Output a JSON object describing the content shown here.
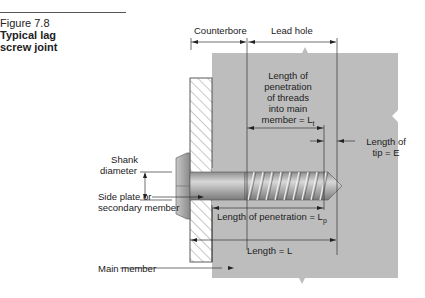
{
  "figure": {
    "number": "Figure 7.8",
    "title_line1": "Typical lag",
    "title_line2": "screw joint"
  },
  "labels": {
    "counterbore": "Counterbore",
    "lead_hole": "Lead hole",
    "threads_line1": "Length of",
    "threads_line2": "penetration",
    "threads_line3": "of threads",
    "threads_line4": "into main",
    "threads_line5": "member = L",
    "threads_sub": "t",
    "tip_line1": "Length of",
    "tip_line2": "tip = E",
    "shank_line1": "Shank",
    "shank_line2": "diameter",
    "side_plate_line1": "Side plate or",
    "side_plate_line2": "secondary member",
    "penetration": "Length of penetration = L",
    "penetration_sub": "p",
    "length": "Length = L",
    "main_member": "Main member"
  },
  "colors": {
    "main_member_fill": "#bdbdbd",
    "screw_fill": "#a9a9a9",
    "line": "#333333"
  }
}
